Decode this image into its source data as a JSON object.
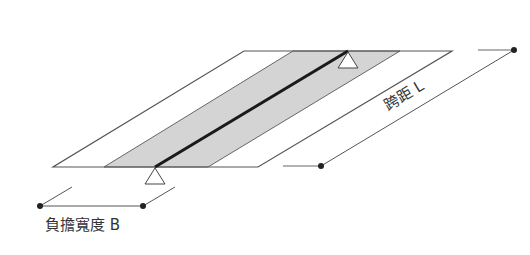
{
  "diagram": {
    "labels": {
      "span": "跨距 L",
      "tributary_width": "負擔寬度 B"
    },
    "colors": {
      "line": "#555555",
      "beam": "#1a1a1a",
      "band_fill": "#d4d4d4",
      "dot": "#222222",
      "text": "#333333"
    }
  }
}
